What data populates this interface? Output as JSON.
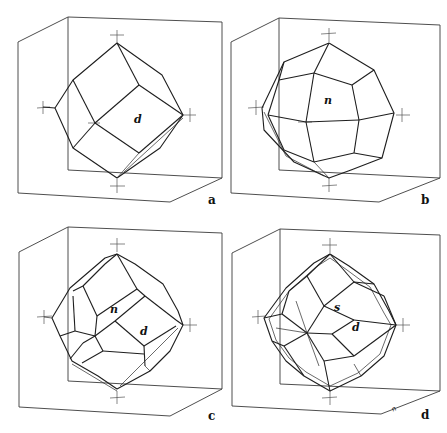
{
  "figure": {
    "panels": [
      {
        "id": "a",
        "label": "a",
        "faces": [
          {
            "label": "d"
          }
        ]
      },
      {
        "id": "b",
        "label": "b",
        "faces": [
          {
            "label": "n"
          }
        ]
      },
      {
        "id": "c",
        "label": "c",
        "faces": [
          {
            "label": "n"
          },
          {
            "label": "d"
          }
        ]
      },
      {
        "id": "d",
        "label": "d",
        "faces": [
          {
            "label": "s"
          },
          {
            "label": "d"
          }
        ],
        "edge_label": "n"
      }
    ]
  },
  "colors": {
    "background": "#ffffff",
    "line": "#1e1e1e",
    "box": "#3a3a3a"
  }
}
